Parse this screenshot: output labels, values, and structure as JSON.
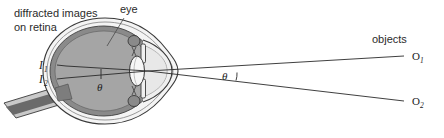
{
  "figure": {
    "background_color": "#ffffff"
  },
  "labels": {
    "diffracted_line1": "diffracted images",
    "diffracted_line2": "on retina",
    "eye": "eye",
    "objects": "objects",
    "image1_letter": "I",
    "image1_sub": "1",
    "image2_letter": "I",
    "image2_sub": "2",
    "object1_letter": "O",
    "object1_sub": "1",
    "object2_letter": "O",
    "object2_sub": "2",
    "theta_inner": "θ",
    "theta_outer": "θ"
  },
  "colors": {
    "sclera_outer": "#e9e9e9",
    "sclera_fill": "#f2f2f2",
    "choroid": "#8f8f8f",
    "vitreous": "#a8a8a8",
    "cornea_fill": "#ededed",
    "lens_fill": "#f4f4f4",
    "iris": "#9a9a9a",
    "ciliary": "#7a7a7a",
    "optic_nerve_dark": "#5e5e5e",
    "optic_nerve_light": "#bdbdbd",
    "outline": "#3a3a3a",
    "ray": "#2a2a2a",
    "text": "#2b2b2b"
  },
  "geometry": {
    "ray_vertex_x": 148,
    "ray_vertex_y": 71,
    "object1_x": 412,
    "object1_y": 56,
    "object2_x": 412,
    "object2_y": 101,
    "image1_x": 58,
    "image1_y": 66,
    "image2_x": 58,
    "image2_y": 78
  }
}
